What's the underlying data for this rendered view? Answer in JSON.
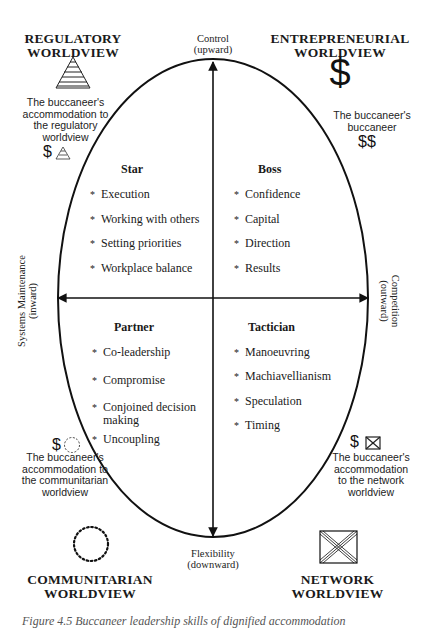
{
  "axes": {
    "top": {
      "line1": "Control",
      "line2": "(upward)"
    },
    "bottom": {
      "line1": "Flexibility",
      "line2": "(downward)"
    },
    "left": {
      "line1": "Systems Maintenance",
      "line2": "(inward)"
    },
    "right": {
      "line1": "Competition",
      "line2": "(outward)"
    }
  },
  "worldviews": {
    "regulatory": {
      "line1": "REGULATORY",
      "line2": "WORLDVIEW",
      "icon": "striped-pyramid-icon"
    },
    "entrepreneurial": {
      "line1": "ENTREPRENEURIAL",
      "line2": "WORLDVIEW",
      "icon": "dollar-sign-icon",
      "symbol": "$"
    },
    "communitarian": {
      "line1": "COMMUNITARIAN",
      "line2": "WORLDVIEW",
      "icon": "dotted-circle-icon"
    },
    "network": {
      "line1": "NETWORK",
      "line2": "WORLDVIEW",
      "icon": "crossed-box-icon"
    }
  },
  "accommodations": {
    "regulatory": {
      "lines": [
        "The buccaneer's",
        "accommodation to",
        "the regulatory",
        "worldview"
      ],
      "symbol": "$"
    },
    "entrepreneurial": {
      "lines": [
        "The buccaneer's",
        "buccaneer"
      ],
      "symbol": "$$"
    },
    "communitarian": {
      "lines": [
        "The buccaneer's",
        "accommodation to",
        "the communitarian",
        "worldview"
      ],
      "symbol": "$"
    },
    "network": {
      "lines": [
        "The buccaneer's",
        "accommodation",
        "to the network",
        "worldview"
      ],
      "symbol": "$"
    }
  },
  "quadrants": {
    "star": {
      "title": "Star",
      "items": [
        "Execution",
        "Working with others",
        "Setting priorities",
        "Workplace balance"
      ]
    },
    "boss": {
      "title": "Boss",
      "items": [
        "Confidence",
        "Capital",
        "Direction",
        "Results"
      ]
    },
    "partner": {
      "title": "Partner",
      "items": [
        "Co-leadership",
        "Compromise",
        "Conjoined decision",
        "making",
        "Uncoupling"
      ]
    },
    "tactician": {
      "title": "Tactician",
      "items": [
        "Manoeuvring",
        "Machiavellianism",
        "Speculation",
        "Timing"
      ]
    }
  },
  "bullet": "*",
  "caption": "Figure 4.5   Buccaneer leadership skills of dignified accommodation"
}
